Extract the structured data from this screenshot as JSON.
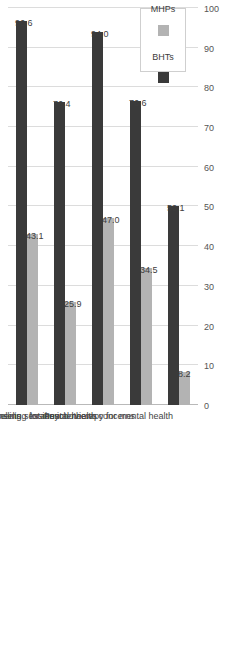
{
  "chart_data": {
    "type": "bar",
    "title": "",
    "xlabel": "",
    "ylabel": "",
    "ylim": [
      0,
      100
    ],
    "grid": true,
    "orientation": "vertical-rotated",
    "legend_position": "top-right",
    "categories": [
      "Risk assessments",
      "Group counselling sessions",
      "Intake interviews",
      "Supportive counseling for mental health concerns",
      "Psychotherapy for mental health"
    ],
    "tick_labels": [
      "0",
      "10",
      "20",
      "30",
      "40",
      "50",
      "60",
      "70",
      "80",
      "90",
      "100"
    ],
    "tick_values": [
      0,
      10,
      20,
      30,
      40,
      50,
      60,
      70,
      80,
      90,
      100
    ],
    "series": [
      {
        "name": "BHTs",
        "color": "#3a3a3a",
        "values": [
          96.6,
          76.4,
          94.0,
          76.6,
          50.1
        ],
        "labels": [
          "96.6",
          "76.4",
          "94.0",
          "76.6",
          "50.1"
        ]
      },
      {
        "name": "MHPs",
        "color": "#b3b3b3",
        "values": [
          43.1,
          25.9,
          47.0,
          34.5,
          8.2
        ],
        "labels": [
          "43.1",
          "25.9",
          "47.0",
          "34.5",
          "8.2"
        ]
      }
    ]
  }
}
